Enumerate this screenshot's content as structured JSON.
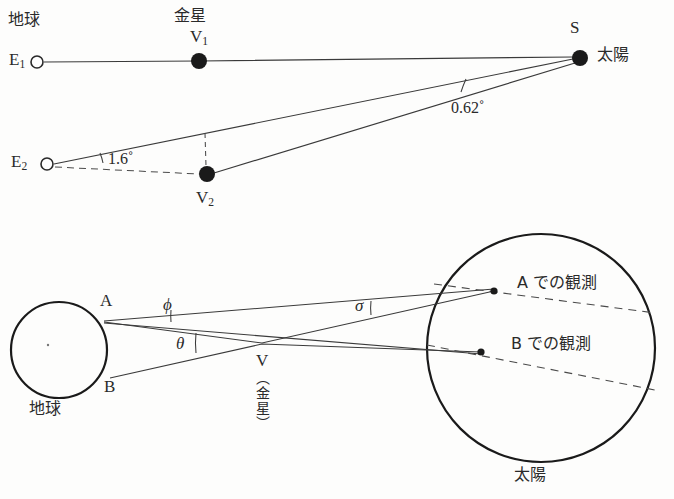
{
  "figure": {
    "title": "",
    "background_color": "#fdfdfc",
    "ink_color": "#2a2a2a"
  },
  "top_panel": {
    "name": "venus-transit-parallax-geometry",
    "labels": {
      "earth_heading": "地球",
      "venus_heading": "金星",
      "sun_label_jp": "太陽",
      "sun_point": "S",
      "earth_1": "E",
      "earth_1_sub": "1",
      "earth_2": "E",
      "earth_2_sub": "2",
      "venus_1": "V",
      "venus_1_sub": "1",
      "venus_2": "V",
      "venus_2_sub": "2",
      "angle_at_sun": "0.62˚",
      "angle_at_earth2": "1.6˚"
    },
    "points": {
      "E1": {
        "x": 37,
        "y": 62,
        "marker": "open-circle",
        "radius": 6
      },
      "V1": {
        "x": 199,
        "y": 61,
        "marker": "filled-circle",
        "radius": 8
      },
      "S": {
        "x": 580,
        "y": 58,
        "marker": "filled-circle",
        "radius": 8
      },
      "E2": {
        "x": 47,
        "y": 164,
        "marker": "open-circle",
        "radius": 6
      },
      "V2": {
        "x": 207,
        "y": 174,
        "marker": "filled-circle",
        "radius": 8
      }
    },
    "angles": {
      "at_sun_degrees": 0.62,
      "at_earth2_degrees": 1.6
    }
  },
  "bottom_panel": {
    "name": "transit-chord-observation-geometry",
    "labels": {
      "earth_label": "地球",
      "sun_label": "太陽",
      "site_a": "A",
      "site_b": "B",
      "venus_point": "V",
      "venus_paren": "（金星）",
      "angle_phi": "ϕ",
      "angle_theta": "θ",
      "angle_sigma": "σ",
      "observation_a": "A での観測",
      "observation_b": "B での観測"
    },
    "earth_circle": {
      "cx": 59,
      "cy": 350,
      "r": 48
    },
    "sun_circle": {
      "cx": 541,
      "cy": 348,
      "r": 114
    },
    "points": {
      "A": {
        "x": 104,
        "y": 320
      },
      "B": {
        "x": 108,
        "y": 376
      },
      "V": {
        "x": 262,
        "y": 343
      },
      "obs_A": {
        "x": 494,
        "y": 291,
        "marker": "filled-dot"
      },
      "obs_B": {
        "x": 481,
        "y": 352,
        "marker": "filled-dot"
      }
    }
  }
}
